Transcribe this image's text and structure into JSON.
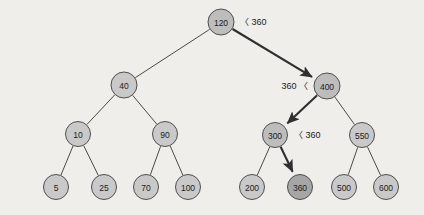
{
  "figure": {
    "background_color": "#efeeea",
    "node_fill_normal": "#c9c9c9",
    "node_fill_path": "#bdbdbd",
    "node_fill_found": "#a6a6a6",
    "node_stroke": "#4f4f4f",
    "edge_color": "#4a4a4a",
    "path_edge_color": "#2f2f2f",
    "search_key": "360"
  },
  "chart_data": {
    "type": "diagram",
    "subtype": "binary-search-tree",
    "search_key": 360,
    "search_path": [
      120,
      400,
      300,
      360
    ],
    "found": true,
    "nodes": [
      {
        "id": "n120",
        "label": "120",
        "value": 120,
        "x": 221,
        "y": 22,
        "r": 13,
        "state": "path"
      },
      {
        "id": "n40",
        "label": "40",
        "value": 40,
        "x": 124,
        "y": 85,
        "r": 13,
        "state": "normal"
      },
      {
        "id": "n400",
        "label": "400",
        "value": 400,
        "x": 327,
        "y": 86,
        "r": 13,
        "state": "path"
      },
      {
        "id": "n10",
        "label": "10",
        "value": 10,
        "x": 78,
        "y": 134,
        "r": 12.5,
        "state": "normal"
      },
      {
        "id": "n90",
        "label": "90",
        "value": 90,
        "x": 165,
        "y": 134,
        "r": 12.5,
        "state": "normal"
      },
      {
        "id": "n300",
        "label": "300",
        "value": 300,
        "x": 275,
        "y": 135,
        "r": 12.5,
        "state": "path"
      },
      {
        "id": "n550",
        "label": "550",
        "value": 550,
        "x": 362,
        "y": 135,
        "r": 12.5,
        "state": "normal"
      },
      {
        "id": "n5",
        "label": "5",
        "value": 5,
        "x": 56,
        "y": 187,
        "r": 12.5,
        "state": "normal"
      },
      {
        "id": "n25",
        "label": "25",
        "value": 25,
        "x": 104,
        "y": 187,
        "r": 12.5,
        "state": "normal"
      },
      {
        "id": "n70",
        "label": "70",
        "value": 70,
        "x": 146,
        "y": 187,
        "r": 12.5,
        "state": "normal"
      },
      {
        "id": "n100",
        "label": "100",
        "value": 100,
        "x": 188,
        "y": 187,
        "r": 12.5,
        "state": "normal"
      },
      {
        "id": "n200",
        "label": "200",
        "value": 200,
        "x": 252,
        "y": 187,
        "r": 12.5,
        "state": "normal"
      },
      {
        "id": "n360",
        "label": "360",
        "value": 360,
        "x": 300,
        "y": 187,
        "r": 12.5,
        "state": "found"
      },
      {
        "id": "n500",
        "label": "500",
        "value": 500,
        "x": 344,
        "y": 187,
        "r": 12.5,
        "state": "normal"
      },
      {
        "id": "n600",
        "label": "600",
        "value": 600,
        "x": 386,
        "y": 187,
        "r": 12.5,
        "state": "normal"
      }
    ],
    "edges": [
      {
        "from": "n120",
        "to": "n40",
        "on_path": false
      },
      {
        "from": "n120",
        "to": "n400",
        "on_path": true
      },
      {
        "from": "n40",
        "to": "n10",
        "on_path": false
      },
      {
        "from": "n40",
        "to": "n90",
        "on_path": false
      },
      {
        "from": "n400",
        "to": "n300",
        "on_path": true
      },
      {
        "from": "n400",
        "to": "n550",
        "on_path": false
      },
      {
        "from": "n10",
        "to": "n5",
        "on_path": false
      },
      {
        "from": "n10",
        "to": "n25",
        "on_path": false
      },
      {
        "from": "n90",
        "to": "n70",
        "on_path": false
      },
      {
        "from": "n90",
        "to": "n100",
        "on_path": false
      },
      {
        "from": "n300",
        "to": "n200",
        "on_path": false
      },
      {
        "from": "n300",
        "to": "n360",
        "on_path": true
      },
      {
        "from": "n550",
        "to": "n500",
        "on_path": false
      },
      {
        "from": "n550",
        "to": "n600",
        "on_path": false
      }
    ],
    "annotations": [
      {
        "id": "a120",
        "text": "〈 360",
        "x": 240,
        "y": 22,
        "align": "left",
        "relates_to": "n120"
      },
      {
        "id": "a400",
        "text": "360 〈",
        "x": 308,
        "y": 86,
        "align": "right",
        "relates_to": "n400"
      },
      {
        "id": "a300",
        "text": "〈 360",
        "x": 294,
        "y": 135,
        "align": "left",
        "relates_to": "n300"
      }
    ]
  }
}
